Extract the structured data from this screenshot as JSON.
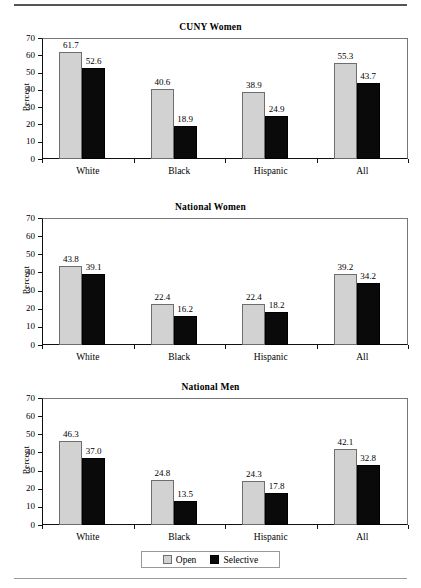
{
  "chart_data": [
    {
      "type": "bar",
      "title": "CUNY Women",
      "xlabel": "",
      "ylabel": "Percent",
      "ylim": [
        0,
        70
      ],
      "yticks": [
        0,
        10,
        20,
        30,
        40,
        50,
        60,
        70
      ],
      "categories": [
        "White",
        "Black",
        "Hispanic",
        "All"
      ],
      "grid": false,
      "legend": "bottom",
      "series": [
        {
          "name": "Open",
          "color": "#d2d2d2",
          "values": [
            61.7,
            40.6,
            38.9,
            55.3
          ]
        },
        {
          "name": "Selective",
          "color": "#0a0a0a",
          "values": [
            52.6,
            18.9,
            24.9,
            43.7
          ]
        }
      ]
    },
    {
      "type": "bar",
      "title": "National Women",
      "xlabel": "",
      "ylabel": "Percent",
      "ylim": [
        0,
        70
      ],
      "yticks": [
        0,
        10,
        20,
        30,
        40,
        50,
        60,
        70
      ],
      "categories": [
        "White",
        "Black",
        "Hispanic",
        "All"
      ],
      "grid": false,
      "legend": "bottom",
      "series": [
        {
          "name": "Open",
          "color": "#d2d2d2",
          "values": [
            43.8,
            22.4,
            22.4,
            39.2
          ]
        },
        {
          "name": "Selective",
          "color": "#0a0a0a",
          "values": [
            39.1,
            16.2,
            18.2,
            34.2
          ]
        }
      ]
    },
    {
      "type": "bar",
      "title": "National Men",
      "xlabel": "",
      "ylabel": "Percent",
      "ylim": [
        0,
        70
      ],
      "yticks": [
        0,
        10,
        20,
        30,
        40,
        50,
        60,
        70
      ],
      "categories": [
        "White",
        "Black",
        "Hispanic",
        "All"
      ],
      "grid": false,
      "legend": "bottom",
      "series": [
        {
          "name": "Open",
          "color": "#d2d2d2",
          "values": [
            46.3,
            24.8,
            24.3,
            42.1
          ]
        },
        {
          "name": "Selective",
          "color": "#0a0a0a",
          "values": [
            37.0,
            13.5,
            17.8,
            32.8
          ]
        }
      ]
    }
  ],
  "legend": {
    "entries": [
      {
        "label": "Open",
        "swatch": "open"
      },
      {
        "label": "Selective",
        "swatch": "selective"
      }
    ]
  }
}
